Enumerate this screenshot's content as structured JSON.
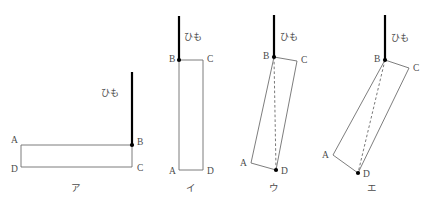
{
  "sheet": {
    "title": "Four orientations of a hanging rectangular plate",
    "background_color": "#ffffff",
    "ink_color": "#6e6e6e",
    "string_color": "#000000",
    "dash_color": "#555555",
    "width": 432,
    "height": 205
  },
  "labels": {
    "string": "ひも",
    "corner_a": "A",
    "corner_b": "B",
    "corner_c": "C",
    "corner_d": "D"
  },
  "figures": [
    {
      "id": "a",
      "caption": "ア",
      "caption_pos": {
        "x": 76,
        "y": 191
      },
      "string": {
        "x1": 132,
        "y1": 72,
        "x2": 132,
        "y2": 145
      },
      "string_label_pos": {
        "x": 101,
        "y": 96
      },
      "pivot": {
        "x": 132,
        "y": 145
      },
      "has_plumb_dash": false,
      "plate": {
        "A": {
          "x": 21,
          "y": 145
        },
        "B": {
          "x": 132,
          "y": 145
        },
        "C": {
          "x": 132,
          "y": 167
        },
        "D": {
          "x": 21,
          "y": 167
        }
      },
      "corner_label_pos": {
        "A": {
          "x": 11,
          "y": 143
        },
        "B": {
          "x": 137,
          "y": 145
        },
        "C": {
          "x": 137,
          "y": 171
        },
        "D": {
          "x": 11,
          "y": 172
        }
      }
    },
    {
      "id": "b",
      "caption": "イ",
      "caption_pos": {
        "x": 191,
        "y": 191
      },
      "string": {
        "x1": 179,
        "y1": 16,
        "x2": 179,
        "y2": 60
      },
      "string_label_pos": {
        "x": 184,
        "y": 40
      },
      "pivot": {
        "x": 179,
        "y": 60
      },
      "has_plumb_dash": false,
      "plate": {
        "A": {
          "x": 179,
          "y": 170
        },
        "B": {
          "x": 179,
          "y": 60
        },
        "C": {
          "x": 203,
          "y": 60
        },
        "D": {
          "x": 203,
          "y": 170
        }
      },
      "corner_label_pos": {
        "A": {
          "x": 169,
          "y": 174
        },
        "B": {
          "x": 169,
          "y": 62
        },
        "C": {
          "x": 207,
          "y": 62
        },
        "D": {
          "x": 207,
          "y": 174
        }
      }
    },
    {
      "id": "c",
      "caption": "ウ",
      "caption_pos": {
        "x": 274,
        "y": 191
      },
      "string": {
        "x1": 274,
        "y1": 15,
        "x2": 274,
        "y2": 57
      },
      "string_label_pos": {
        "x": 280,
        "y": 40
      },
      "pivot": {
        "x": 274,
        "y": 57
      },
      "has_plumb_dash": true,
      "plumb_dash": {
        "x1": 274,
        "y1": 57,
        "x2": 276,
        "y2": 170
      },
      "plate": {
        "A": {
          "x": 251,
          "y": 163
        },
        "B": {
          "x": 274,
          "y": 57
        },
        "C": {
          "x": 297,
          "y": 61
        },
        "D": {
          "x": 276,
          "y": 170
        }
      },
      "corner_label_pos": {
        "A": {
          "x": 240,
          "y": 166
        },
        "B": {
          "x": 263,
          "y": 59
        },
        "C": {
          "x": 301,
          "y": 63
        },
        "D": {
          "x": 281,
          "y": 174
        }
      }
    },
    {
      "id": "d",
      "caption": "エ",
      "caption_pos": {
        "x": 372,
        "y": 191
      },
      "string": {
        "x1": 385,
        "y1": 15,
        "x2": 385,
        "y2": 60
      },
      "string_label_pos": {
        "x": 391,
        "y": 41
      },
      "pivot": {
        "x": 385,
        "y": 60
      },
      "has_plumb_dash": true,
      "plumb_dash": {
        "x1": 385,
        "y1": 60,
        "x2": 358,
        "y2": 173
      },
      "plate": {
        "A": {
          "x": 333,
          "y": 155
        },
        "B": {
          "x": 385,
          "y": 60
        },
        "C": {
          "x": 409,
          "y": 68
        },
        "D": {
          "x": 358,
          "y": 173
        }
      },
      "corner_label_pos": {
        "A": {
          "x": 322,
          "y": 158
        },
        "B": {
          "x": 374,
          "y": 62
        },
        "C": {
          "x": 413,
          "y": 71
        },
        "D": {
          "x": 363,
          "y": 177
        }
      }
    }
  ]
}
